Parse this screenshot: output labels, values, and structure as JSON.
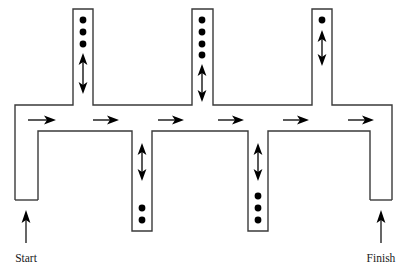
{
  "figure": {
    "type": "maze-flow-diagram",
    "title": "",
    "background_color": "#ffffff",
    "wall_color": "#3a3a3a",
    "ink_color": "#000000"
  },
  "labels": {
    "start": "Start",
    "finish": "Finish"
  },
  "corridor": {
    "name": "main-horizontal-corridor",
    "flow_direction": "right",
    "arrow_count": 6,
    "arrow_x_positions": [
      28,
      93,
      158,
      218,
      283,
      348
    ],
    "arrow_y": 120,
    "arrow_length": 22
  },
  "entry": {
    "name": "start-passage",
    "direction": "up",
    "arrow_x": 26,
    "arrow_y_top": 213,
    "arrow_y_bottom": 243,
    "label_x": 26,
    "label_y": 260
  },
  "exit": {
    "name": "finish-passage",
    "direction": "up",
    "arrow_x": 381,
    "arrow_y_top": 213,
    "arrow_y_bottom": 243,
    "label_x": 381,
    "label_y": 260
  },
  "branches": [
    {
      "id": "top-branch-1",
      "side": "top",
      "x_center": 83,
      "dots": 3,
      "dot_y_positions": [
        20,
        32,
        44
      ],
      "double_arrow": {
        "y_top": 55,
        "y_bottom": 92
      }
    },
    {
      "id": "top-branch-2",
      "side": "top",
      "x_center": 202,
      "dots": 4,
      "dot_y_positions": [
        20,
        32,
        44,
        55
      ],
      "double_arrow": {
        "y_top": 64,
        "y_bottom": 100
      }
    },
    {
      "id": "top-branch-3",
      "side": "top",
      "x_center": 322,
      "dots": 1,
      "dot_y_positions": [
        20
      ],
      "double_arrow": {
        "y_top": 30,
        "y_bottom": 64
      }
    },
    {
      "id": "bottom-branch-1",
      "side": "bottom",
      "x_center": 142,
      "dots": 2,
      "dot_y_positions": [
        208,
        220
      ],
      "double_arrow": {
        "y_top": 143,
        "y_bottom": 180
      }
    },
    {
      "id": "bottom-branch-2",
      "side": "bottom",
      "x_center": 258,
      "dots": 3,
      "dot_y_positions": [
        196,
        208,
        220
      ],
      "double_arrow": {
        "y_top": 143,
        "y_bottom": 180
      }
    }
  ],
  "geometry": {
    "corridor_top_y": 105,
    "corridor_bottom_y": 131,
    "branch_half_width": 10,
    "top_branch_cap_y": 9,
    "bottom_branch_cap_y": 231,
    "start_left_x": 15,
    "start_right_x": 38,
    "start_cap_y": 200,
    "finish_left_x": 370,
    "finish_right_x": 392,
    "finish_cap_y": 200,
    "left_edge_x": 15,
    "right_edge_x": 392
  }
}
